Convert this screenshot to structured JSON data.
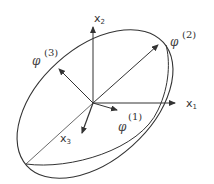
{
  "diagram": {
    "type": "ellipsoid-principal-axes",
    "colors": {
      "stroke": "#333333",
      "background": "#ffffff"
    },
    "axes": {
      "x1": {
        "label": "x",
        "sub": "1"
      },
      "x2": {
        "label": "x",
        "sub": "2"
      },
      "x3": {
        "label": "x",
        "sub": "3"
      }
    },
    "principal_directions": [
      {
        "id": "1",
        "symbol": "φ",
        "index": "(1)"
      },
      {
        "id": "2",
        "symbol": "φ",
        "index": "(2)"
      },
      {
        "id": "3",
        "symbol": "φ",
        "index": "(3)"
      }
    ]
  }
}
